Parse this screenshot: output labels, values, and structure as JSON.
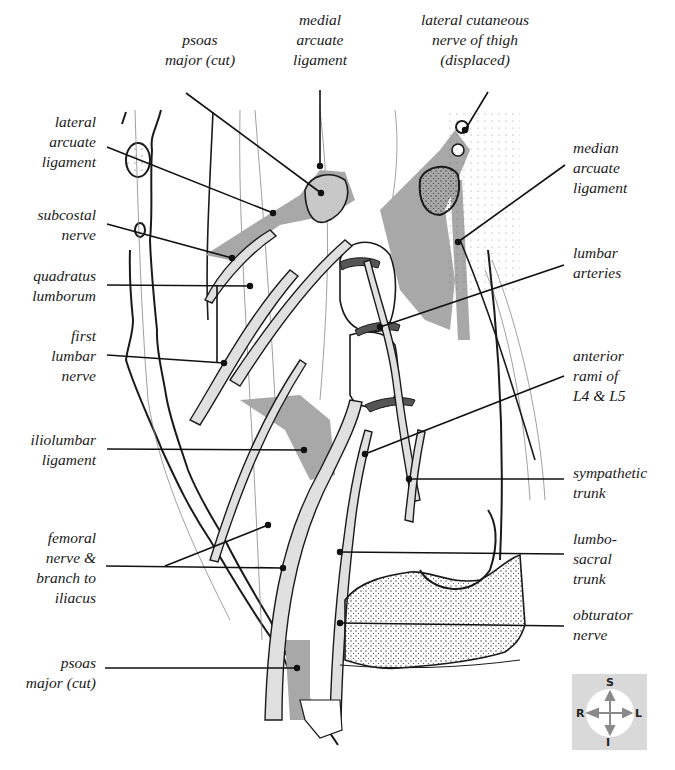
{
  "figure": {
    "type": "anatomical-diagram",
    "colors": {
      "outline": "#1a1a1a",
      "muscle_shade": "#a8a8a8",
      "nerve_fill": "#e0e0e0",
      "artery_dark": "#555555",
      "stipple": "#333333",
      "compass_bg": "#d9d9d9",
      "compass_arrow": "#8a8a8a"
    }
  },
  "labels": {
    "top": [
      {
        "id": "psoas-major-cut-top",
        "text": "psoas\nmajor (cut)",
        "x": 140,
        "y": 30,
        "w": 120,
        "line": [
          [
            186,
            93
          ],
          [
            321,
            193
          ]
        ]
      },
      {
        "id": "medial-arcuate-ligament",
        "text": "medial\narcuate\nligament",
        "x": 280,
        "y": 10,
        "w": 80,
        "line": [
          [
            320,
            90
          ],
          [
            320,
            166
          ]
        ]
      },
      {
        "id": "lateral-cutaneous-nerve-of-thigh",
        "text": "lateral cutaneous\nnerve of thigh\n(displaced)",
        "x": 395,
        "y": 10,
        "w": 160,
        "line": [
          [
            488,
            92
          ],
          [
            465,
            130
          ]
        ]
      }
    ],
    "left": [
      {
        "id": "lateral-arcuate-ligament",
        "text": "lateral\narcuate\nligament",
        "x": 0,
        "y": 112,
        "w": 96,
        "line": [
          [
            107,
            147
          ],
          [
            273,
            213
          ]
        ]
      },
      {
        "id": "subcostal-nerve",
        "text": "subcostal\nnerve",
        "x": 0,
        "y": 205,
        "w": 96,
        "line": [
          [
            107,
            224
          ],
          [
            232,
            258
          ]
        ]
      },
      {
        "id": "quadratus-lumborum",
        "text": "quadratus\nlumborum",
        "x": 0,
        "y": 266,
        "w": 96,
        "line": [
          [
            107,
            285
          ],
          [
            250,
            286
          ]
        ]
      },
      {
        "id": "first-lumbar-nerve",
        "text": "first\nlumbar\nnerve",
        "x": 0,
        "y": 326,
        "w": 96,
        "line": [
          [
            107,
            355
          ],
          [
            224,
            363
          ]
        ]
      },
      {
        "id": "iliolumbar-ligament",
        "text": "iliolumbar\nligament",
        "x": 0,
        "y": 430,
        "w": 96,
        "line": [
          [
            107,
            449
          ],
          [
            304,
            450
          ]
        ]
      },
      {
        "id": "femoral-nerve-branch-to-iliacus",
        "text": "femoral\nnerve &\nbranch to\niliacus",
        "x": 0,
        "y": 528,
        "w": 96,
        "line": [
          [
            106,
            566
          ],
          [
            283,
            568
          ]
        ],
        "branch": [
          [
            165,
            566
          ],
          [
            268,
            525
          ]
        ]
      },
      {
        "id": "psoas-major-cut-bottom",
        "text": "psoas\nmajor (cut)",
        "x": 0,
        "y": 653,
        "w": 96,
        "line": [
          [
            105,
            668
          ],
          [
            297,
            668
          ]
        ]
      }
    ],
    "right": [
      {
        "id": "median-arcuate-ligament",
        "text": "median\narcuate\nligament",
        "x": 573,
        "y": 138,
        "w": 100,
        "line": [
          [
            565,
            165
          ],
          [
            458,
            242
          ]
        ]
      },
      {
        "id": "lumbar-arteries",
        "text": "lumbar\narteries",
        "x": 573,
        "y": 243,
        "w": 100,
        "line": [
          [
            564,
            265
          ],
          [
            380,
            327
          ]
        ]
      },
      {
        "id": "anterior-rami-of-l4-l5",
        "text": "anterior\nrami of\nL4 & L5",
        "x": 573,
        "y": 346,
        "w": 100,
        "line": [
          [
            564,
            376
          ],
          [
            365,
            454
          ]
        ]
      },
      {
        "id": "sympathetic-trunk",
        "text": "sympathetic\ntrunk",
        "x": 573,
        "y": 463,
        "w": 100,
        "line": [
          [
            564,
            479
          ],
          [
            409,
            479
          ]
        ]
      },
      {
        "id": "lumbo-sacral-trunk",
        "text": "lumbo-\nsacral\ntrunk",
        "x": 573,
        "y": 529,
        "w": 100,
        "line": [
          [
            564,
            554
          ],
          [
            340,
            552
          ]
        ]
      },
      {
        "id": "obturator-nerve",
        "text": "obturator\nnerve",
        "x": 573,
        "y": 605,
        "w": 100,
        "line": [
          [
            564,
            626
          ],
          [
            340,
            623
          ]
        ]
      }
    ]
  },
  "connector": {
    "id": "quadratus-to-first-lumbar",
    "line": [
      [
        217,
        286
      ],
      [
        217,
        362
      ]
    ]
  },
  "compass": {
    "superior": "S",
    "inferior": "I",
    "right": "R",
    "left": "L"
  }
}
